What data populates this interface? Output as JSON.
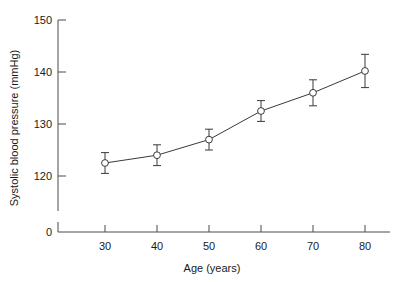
{
  "chart_data": {
    "type": "line",
    "title": "",
    "xlabel": "Age (years)",
    "ylabel": "Systolic blood pressure (mmHg)",
    "x": [
      30,
      40,
      50,
      60,
      70,
      80
    ],
    "values": [
      122.5,
      124.0,
      127.0,
      132.5,
      136.0,
      140.2
    ],
    "error_upper": [
      2.0,
      2.0,
      2.0,
      2.0,
      2.5,
      3.2
    ],
    "error_lower": [
      2.0,
      2.0,
      2.0,
      2.0,
      2.5,
      3.2
    ],
    "xtick_labels": [
      "30",
      "40",
      "50",
      "60",
      "70",
      "80"
    ],
    "ytick_labels": [
      "0",
      "120",
      "130",
      "140",
      "150"
    ],
    "ylim": [
      118,
      151
    ],
    "xlim": [
      25,
      85
    ],
    "axis_break": true,
    "zero_label": "0",
    "grid": false,
    "legend": null,
    "marker": "open-circle",
    "line_color": "#3a3a3a",
    "marker_fill": "#ffffff",
    "background": "#ffffff"
  },
  "axes": {
    "y_title": "Systolic blood pressure (mmHg)",
    "x_title": "Age (years)",
    "y_ticks": [
      {
        "label": "150",
        "value": 150
      },
      {
        "label": "140",
        "value": 140
      },
      {
        "label": "130",
        "value": 130
      },
      {
        "label": "120",
        "value": 120
      },
      {
        "label": "0",
        "value": 0
      }
    ],
    "x_ticks": [
      {
        "label": "30",
        "value": 30
      },
      {
        "label": "40",
        "value": 40
      },
      {
        "label": "50",
        "value": 50
      },
      {
        "label": "60",
        "value": 60
      },
      {
        "label": "70",
        "value": 70
      },
      {
        "label": "80",
        "value": 80
      }
    ]
  }
}
